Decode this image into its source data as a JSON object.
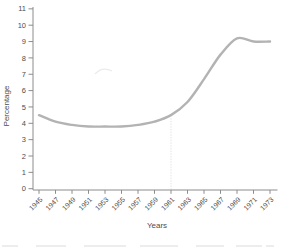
{
  "chart_data": {
    "type": "line",
    "title": "",
    "xlabel": "Years",
    "ylabel": "Percentage",
    "x": [
      1945,
      1947,
      1949,
      1951,
      1953,
      1955,
      1957,
      1959,
      1961,
      1963,
      1965,
      1967,
      1969,
      1971,
      1973
    ],
    "series": [
      {
        "name": "percentage",
        "values": [
          4.5,
          4.1,
          3.9,
          3.8,
          3.8,
          3.8,
          3.9,
          4.1,
          4.5,
          5.3,
          6.7,
          8.2,
          9.2,
          9.0,
          9.0
        ],
        "color": "#b3b3b3"
      }
    ],
    "ylim": [
      0,
      11
    ],
    "yticks": [
      0,
      1,
      2,
      3,
      4,
      5,
      6,
      7,
      8,
      9,
      10,
      11
    ],
    "grid": false,
    "legend": "none",
    "annotations": [
      {
        "type": "vertical-guide",
        "x": 1961
      }
    ]
  },
  "colors": {
    "background": "#ffffff",
    "axis": "#8c8c8c",
    "tick_label": "#4d4d4d",
    "line": "#b3b3b3",
    "guide": "#e0e0e0"
  }
}
